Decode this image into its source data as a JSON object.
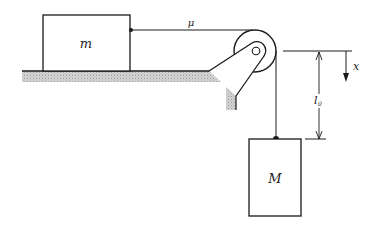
{
  "diagram": {
    "type": "physics-free-body",
    "colors": {
      "line": "#1a1a1a",
      "hatch": "#b8b8b8",
      "background": "#ffffff"
    },
    "labels": {
      "block_on_table": "m",
      "hanging_block": "M",
      "friction_coefficient": "μ",
      "displacement": "x",
      "initial_length": "l",
      "initial_length_subscript": "0"
    }
  }
}
